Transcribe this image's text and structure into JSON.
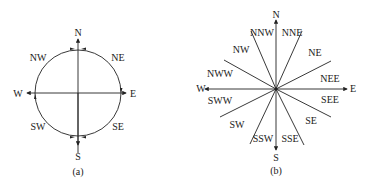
{
  "figure_a": {
    "caption": "(a)",
    "labels": {
      "N": "N",
      "S": "S",
      "E": "E",
      "W": "W",
      "NE": "NE",
      "NW": "NW",
      "SE": "SE",
      "SW": "SW"
    }
  },
  "figure_b": {
    "caption": "(b)",
    "labels": {
      "N": "N",
      "S": "S",
      "E": "E",
      "W": "W",
      "NNW": "NNW",
      "NNE": "NNE",
      "NW": "NW",
      "NE": "NE",
      "NWW": "NWW",
      "NEE": "NEE",
      "SWW": "SWW",
      "SEE": "SEE",
      "SW": "SW",
      "SE": "SE",
      "SSW": "SSW",
      "SSE": "SSE"
    }
  },
  "colors": {
    "stroke": "#222222",
    "text": "#1a1a1a",
    "background": "#ffffff"
  }
}
